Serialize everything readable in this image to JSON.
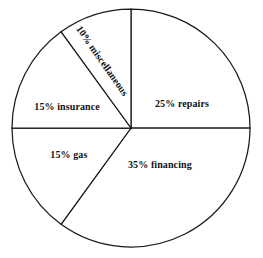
{
  "chart_data": {
    "type": "pie",
    "title": "",
    "subtitle": "",
    "xlabel": "",
    "ylabel": "",
    "legend": "none",
    "grid": false,
    "categories": [
      "repairs",
      "financing",
      "gas",
      "insurance",
      "miscellaneous"
    ],
    "values": [
      25,
      35,
      15,
      15,
      10
    ],
    "units": "percent",
    "total": 100,
    "slices": [
      {
        "label": "25% repairs",
        "category": "repairs",
        "value": 25,
        "start_pct": 0,
        "end_pct": 25,
        "label_x_pct": 69.2,
        "label_y_pct": 40.3,
        "rotated": false
      },
      {
        "label": "35% financing",
        "category": "financing",
        "value": 35,
        "start_pct": 25,
        "end_pct": 60,
        "label_x_pct": 60.8,
        "label_y_pct": 64.0,
        "rotated": false
      },
      {
        "label": "15% gas",
        "category": "gas",
        "value": 15,
        "start_pct": 60,
        "end_pct": 75,
        "label_x_pct": 26.2,
        "label_y_pct": 60.1,
        "rotated": false
      },
      {
        "label": "15% insurance",
        "category": "insurance",
        "value": 15,
        "start_pct": 75,
        "end_pct": 90,
        "label_x_pct": 25.5,
        "label_y_pct": 41.5,
        "rotated": false
      },
      {
        "label": "10% miscellaneous",
        "category": "miscellaneous",
        "value": 10,
        "start_pct": 90,
        "end_pct": 100,
        "label_x_pct": 38.8,
        "label_y_pct": 23.6,
        "rotated": true
      }
    ],
    "geometry": {
      "center_x": 131,
      "center_y": 128,
      "radius": 119
    },
    "colors": {
      "slice_fill": "#ffffff",
      "slice_stroke": "#1a1a1a",
      "background": "#ffffff",
      "label_text": "#111111"
    }
  }
}
